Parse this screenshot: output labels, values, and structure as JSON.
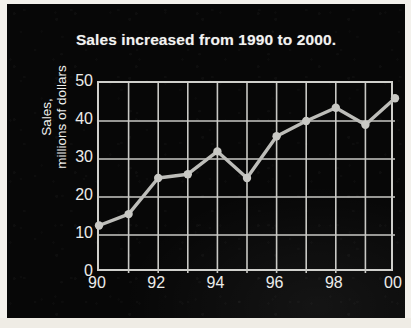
{
  "figure": {
    "background_color": "#070707",
    "ink_color": "#cfcfcb",
    "title": "Sales increased from 1990 to 2000."
  },
  "axis": {
    "y_title_line1": "Sales,",
    "y_title_line2": "millions of dollars",
    "y_ticks": [
      "0",
      "10",
      "20",
      "30",
      "40",
      "50"
    ],
    "x_ticks": [
      "90",
      "",
      "92",
      "",
      "94",
      "",
      "96",
      "",
      "98",
      "",
      "00"
    ]
  },
  "chart_data": {
    "type": "line",
    "title": "Sales increased from 1990 to 2000.",
    "xlabel": "",
    "ylabel": "Sales, millions of dollars",
    "categories": [
      "90",
      "91",
      "92",
      "93",
      "94",
      "95",
      "96",
      "97",
      "98",
      "99",
      "00"
    ],
    "x": [
      1990,
      1991,
      1992,
      1993,
      1994,
      1995,
      1996,
      1997,
      1998,
      1999,
      2000
    ],
    "values": [
      12.5,
      15.5,
      25,
      26,
      32,
      25,
      36,
      40,
      43.5,
      39,
      46
    ],
    "series": [
      {
        "name": "Sales",
        "values": [
          12.5,
          15.5,
          25,
          26,
          32,
          25,
          36,
          40,
          43.5,
          39,
          46
        ]
      }
    ],
    "ylim": [
      0,
      50
    ],
    "ytick_values": [
      0,
      10,
      20,
      30,
      40,
      50
    ],
    "xlim": [
      1990,
      2000
    ],
    "xtick_labels": [
      "90",
      "92",
      "94",
      "96",
      "98",
      "00"
    ],
    "grid": true,
    "legend": "none",
    "marker": "circle",
    "line_color": "#bdbdb9"
  }
}
